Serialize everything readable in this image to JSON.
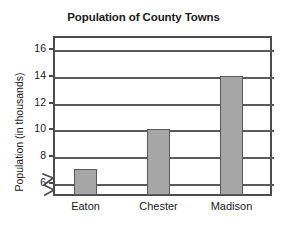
{
  "chart_data": {
    "type": "bar",
    "title": "Population of County Towns",
    "xlabel": "",
    "ylabel": "Population (in thousands)",
    "categories": [
      "Eaton",
      "Chester",
      "Madison"
    ],
    "values": [
      7,
      10,
      14
    ],
    "ylim": [
      5,
      17
    ],
    "yticks": [
      6,
      8,
      10,
      12,
      14,
      16
    ],
    "ytick_labels": [
      "6",
      "8",
      "10",
      "12",
      "14",
      "16"
    ],
    "grid": true,
    "grid_axis": "y",
    "legend": null,
    "axis_break": true,
    "axis_break_note": "zigzag break on y-axis below 6",
    "bar_fill_color": "#a6a6a6",
    "bar_edge_color": "#595959",
    "frame_color": "#4c4c4c",
    "gridline_color": "#5a5a5a",
    "background_color": "#ffffff",
    "text_color": "#1a1a1a"
  },
  "axis": {
    "y_title": "Population (in thousands)"
  }
}
